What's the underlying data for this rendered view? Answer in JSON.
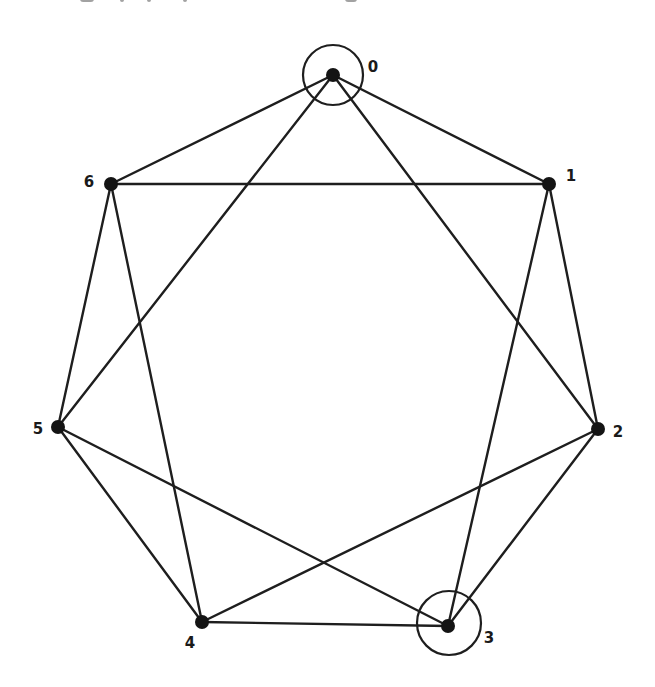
{
  "diagram": {
    "type": "graph",
    "colors": {
      "edge": "#1e1e1e",
      "node": "#141414",
      "background": "#ffffff"
    },
    "nodes": [
      {
        "id": "0",
        "label": "0",
        "x": 333,
        "y": 75,
        "label_x": 373,
        "label_y": 67,
        "highlighted": true
      },
      {
        "id": "1",
        "label": "1",
        "x": 549,
        "y": 184,
        "label_x": 571,
        "label_y": 176,
        "highlighted": false
      },
      {
        "id": "2",
        "label": "2",
        "x": 598,
        "y": 429,
        "label_x": 618,
        "label_y": 432,
        "highlighted": false
      },
      {
        "id": "3",
        "label": "3",
        "x": 448,
        "y": 626,
        "label_x": 489,
        "label_y": 638,
        "highlighted": true
      },
      {
        "id": "4",
        "label": "4",
        "x": 202,
        "y": 622,
        "label_x": 190,
        "label_y": 643,
        "highlighted": false
      },
      {
        "id": "5",
        "label": "5",
        "x": 58,
        "y": 427,
        "label_x": 38,
        "label_y": 429,
        "highlighted": false
      },
      {
        "id": "6",
        "label": "6",
        "x": 111,
        "y": 184,
        "label_x": 89,
        "label_y": 182,
        "highlighted": false
      }
    ],
    "highlight_circles": [
      {
        "node": "0",
        "cx": 333,
        "cy": 75,
        "r": 30
      },
      {
        "node": "3",
        "cx": 449,
        "cy": 623,
        "r": 32
      }
    ],
    "edges": [
      [
        "0",
        "1"
      ],
      [
        "0",
        "6"
      ],
      [
        "0",
        "5"
      ],
      [
        "0",
        "2"
      ],
      [
        "1",
        "6"
      ],
      [
        "1",
        "2"
      ],
      [
        "1",
        "3"
      ],
      [
        "6",
        "5"
      ],
      [
        "6",
        "4"
      ],
      [
        "5",
        "3"
      ],
      [
        "5",
        "4"
      ],
      [
        "2",
        "4"
      ],
      [
        "2",
        "3"
      ],
      [
        "4",
        "3"
      ]
    ]
  }
}
